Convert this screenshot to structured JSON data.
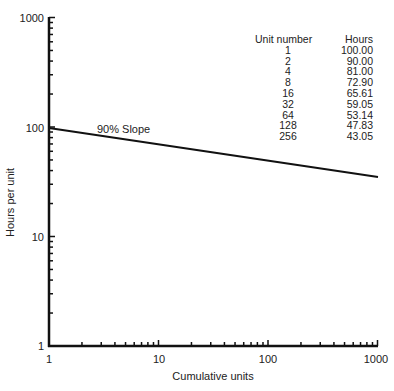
{
  "chart_data": {
    "type": "line",
    "title": "",
    "xlabel": "Cumulative units",
    "ylabel": "Hours per unit",
    "xscale": "log",
    "yscale": "log",
    "xlim": [
      1,
      1000
    ],
    "ylim": [
      1,
      1000
    ],
    "x_ticks": [
      "1",
      "10",
      "100",
      "1000"
    ],
    "y_ticks": [
      "1",
      "10",
      "100",
      "1000"
    ],
    "grid": false,
    "annotation": "90% Slope",
    "series": [
      {
        "name": "90% Slope",
        "x": [
          1,
          1000
        ],
        "y": [
          100,
          35.2
        ]
      }
    ],
    "table": {
      "headers": [
        "Unit number",
        "Hours"
      ],
      "rows": [
        [
          "1",
          "100.00"
        ],
        [
          "2",
          "90.00"
        ],
        [
          "4",
          "81.00"
        ],
        [
          "8",
          "72.90"
        ],
        [
          "16",
          "65.61"
        ],
        [
          "32",
          "59.05"
        ],
        [
          "64",
          "53.14"
        ],
        [
          "128",
          "47.83"
        ],
        [
          "256",
          "43.05"
        ]
      ]
    }
  },
  "labels": {
    "xlabel": "Cumulative units",
    "ylabel": "Hours per unit",
    "annotation": "90% Slope",
    "x_ticks": [
      "1",
      "10",
      "100",
      "1000"
    ],
    "y_ticks": [
      "1000",
      "100",
      "10",
      "1"
    ]
  },
  "table": {
    "header_unit": "Unit number",
    "header_hours": "Hours",
    "rows": [
      {
        "unit": "1",
        "hours": "100.00"
      },
      {
        "unit": "2",
        "hours": "90.00"
      },
      {
        "unit": "4",
        "hours": "81.00"
      },
      {
        "unit": "8",
        "hours": "72.90"
      },
      {
        "unit": "16",
        "hours": "65.61"
      },
      {
        "unit": "32",
        "hours": "59.05"
      },
      {
        "unit": "64",
        "hours": "53.14"
      },
      {
        "unit": "128",
        "hours": "47.83"
      },
      {
        "unit": "256",
        "hours": "43.05"
      }
    ]
  }
}
